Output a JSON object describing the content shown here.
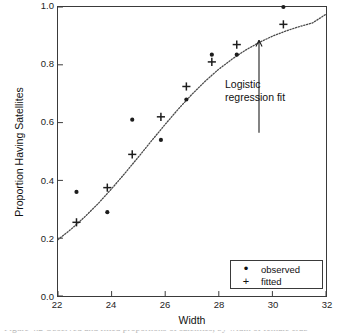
{
  "chart_data": {
    "type": "scatter",
    "title": "",
    "xlabel": "Width",
    "ylabel": "Proportion Having Satellites",
    "xlim": [
      22,
      32
    ],
    "ylim": [
      0.0,
      1.0
    ],
    "xticks": [
      "22",
      "24",
      "26",
      "28",
      "30",
      "32"
    ],
    "xtick_values": [
      22,
      24,
      26,
      28,
      30,
      32
    ],
    "yticks": [
      "0.0",
      "0.2",
      "0.4",
      "0.6",
      "0.8",
      "1.0"
    ],
    "ytick_values": [
      0.0,
      0.2,
      0.4,
      0.6,
      0.8,
      1.0
    ],
    "grid": false,
    "legend_position": "lower right",
    "series": [
      {
        "name": "observed",
        "marker": "dot",
        "x": [
          22.69,
          23.84,
          24.77,
          25.84,
          26.79,
          27.74,
          28.67,
          30.41
        ],
        "values": [
          0.36,
          0.29,
          0.61,
          0.54,
          0.68,
          0.835,
          0.835,
          1.0
        ]
      },
      {
        "name": "fitted",
        "marker": "plus",
        "x": [
          22.69,
          23.84,
          24.77,
          25.84,
          26.79,
          27.74,
          28.67,
          30.41
        ],
        "values": [
          0.255,
          0.375,
          0.49,
          0.62,
          0.725,
          0.81,
          0.87,
          0.94
        ]
      },
      {
        "name": "Logistic regression fit",
        "marker": "dotted-line",
        "x": [
          22.0,
          22.5,
          23.0,
          23.5,
          24.0,
          24.5,
          25.0,
          25.5,
          26.0,
          26.5,
          27.0,
          27.5,
          28.0,
          28.5,
          29.0,
          29.5,
          30.0,
          30.5,
          31.0,
          31.5,
          32.0
        ],
        "values": [
          0.195,
          0.232,
          0.274,
          0.32,
          0.371,
          0.425,
          0.481,
          0.538,
          0.594,
          0.648,
          0.698,
          0.744,
          0.785,
          0.82,
          0.851,
          0.877,
          0.899,
          0.917,
          0.932,
          0.945,
          0.975
        ]
      }
    ],
    "annotations": [
      {
        "name": "logistic-fit-annotation",
        "line1": "Logistic",
        "line2": "regression fit",
        "arrow": "up",
        "points_to_x": 29.5,
        "points_to_y": 0.885
      }
    ]
  },
  "axes": {
    "x_title": "Width",
    "y_title": "Proportion Having Satellites"
  },
  "legend": {
    "items": [
      {
        "key": "•",
        "label": "observed",
        "marker_name": "dot-marker"
      },
      {
        "key": "+",
        "label": "fitted",
        "marker_name": "plus-marker"
      }
    ]
  },
  "caption": {
    "text": "Figure 4.2  Observed and fitted proportions of satellites, by width of female crab"
  }
}
